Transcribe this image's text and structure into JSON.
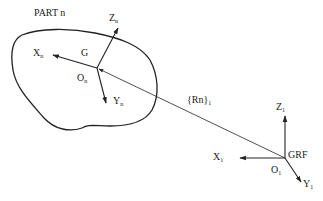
{
  "part": {
    "title": "PART n",
    "center_label": "G",
    "origin_label": "O",
    "origin_sub": "n",
    "axes": {
      "x": {
        "label": "X",
        "sub": "n"
      },
      "y": {
        "label": "Y",
        "sub": "n"
      },
      "z": {
        "label": "Z",
        "sub": "n"
      }
    }
  },
  "vector": {
    "label": "{Rn}",
    "sub": "1"
  },
  "grf": {
    "title": "GRF",
    "origin_label": "O",
    "origin_sub": "1",
    "axes": {
      "x": {
        "label": "X",
        "sub": "1"
      },
      "y": {
        "label": "Y",
        "sub": "1"
      },
      "z": {
        "label": "Z",
        "sub": "1"
      }
    }
  },
  "colors": {
    "stroke": "#222222",
    "text": "#222222",
    "background": "#ffffff"
  }
}
